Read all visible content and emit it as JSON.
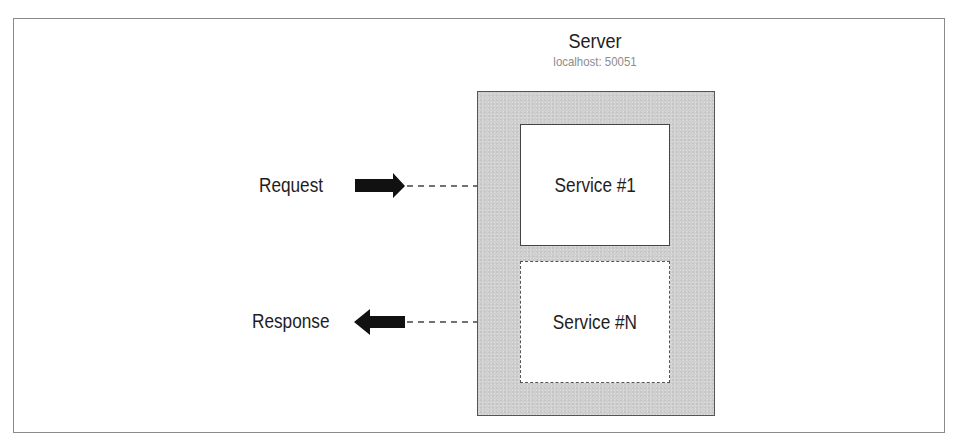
{
  "server": {
    "title": "Server",
    "address": "localhost: 50051"
  },
  "services": [
    {
      "label": "Service #1",
      "border_style": "solid"
    },
    {
      "label": "Service #N",
      "border_style": "dashed"
    }
  ],
  "flows": {
    "request": {
      "label": "Request",
      "direction": "right-arrow-icon"
    },
    "response": {
      "label": "Response",
      "direction": "left-arrow-icon"
    }
  },
  "colors": {
    "server_fill": "#d0d0d0",
    "text": "#1e1e1e",
    "subtitle": "#8c8c8c",
    "arrow": "#111111"
  }
}
